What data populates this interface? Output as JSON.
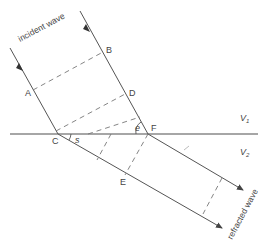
{
  "diagram": {
    "labels": {
      "incident": "incident wave",
      "refracted": "refracted wave",
      "A": "A",
      "B": "B",
      "C": "C",
      "D": "D",
      "E": "E",
      "F": "F",
      "e": "e",
      "s": "s",
      "v1": "V",
      "v1_sub": "1",
      "v2": "V",
      "v2_sub": "2"
    },
    "colors": {
      "line": "#555555",
      "interface": "#888888",
      "dashed": "#777777"
    }
  }
}
